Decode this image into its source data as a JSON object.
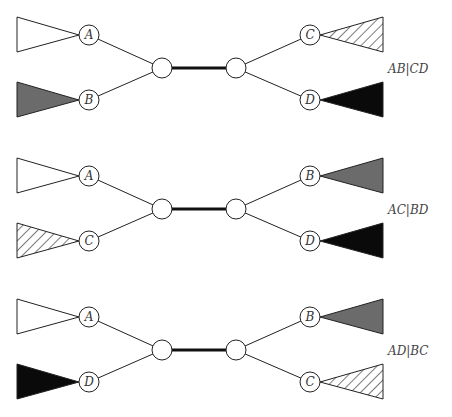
{
  "figure": {
    "fills": {
      "white": "#ffffff",
      "gray": "#6b6b6b",
      "black": "#0a0a0a",
      "hatched": "hatch"
    },
    "rows": [
      {
        "split_label": "AB|CD",
        "left": [
          {
            "leaf": "A",
            "fill": "white"
          },
          {
            "leaf": "B",
            "fill": "gray"
          }
        ],
        "right": [
          {
            "leaf": "C",
            "fill": "hatched"
          },
          {
            "leaf": "D",
            "fill": "black"
          }
        ]
      },
      {
        "split_label": "AC|BD",
        "left": [
          {
            "leaf": "A",
            "fill": "white"
          },
          {
            "leaf": "C",
            "fill": "hatched"
          }
        ],
        "right": [
          {
            "leaf": "B",
            "fill": "gray"
          },
          {
            "leaf": "D",
            "fill": "black"
          }
        ]
      },
      {
        "split_label": "AD|BC",
        "left": [
          {
            "leaf": "A",
            "fill": "white"
          },
          {
            "leaf": "D",
            "fill": "black"
          }
        ],
        "right": [
          {
            "leaf": "B",
            "fill": "gray"
          },
          {
            "leaf": "C",
            "fill": "hatched"
          }
        ]
      }
    ]
  }
}
